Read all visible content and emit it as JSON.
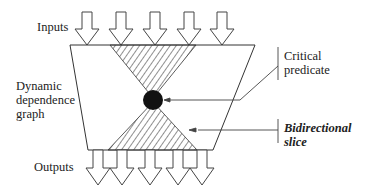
{
  "labels": {
    "inputs": "Inputs",
    "outputs": "Outputs",
    "graph_line1": "Dynamic",
    "graph_line2": "dependence",
    "graph_line3": "graph",
    "critical_line1": "Critical",
    "critical_line2": "predicate",
    "slice_line1": "Bidirectional",
    "slice_line2": "slice"
  },
  "diagram": {
    "input_arrow_count": 5,
    "output_arrow_count": 5,
    "colors": {
      "stroke": "#333333",
      "node_fill": "#111111",
      "background": "#ffffff"
    }
  }
}
